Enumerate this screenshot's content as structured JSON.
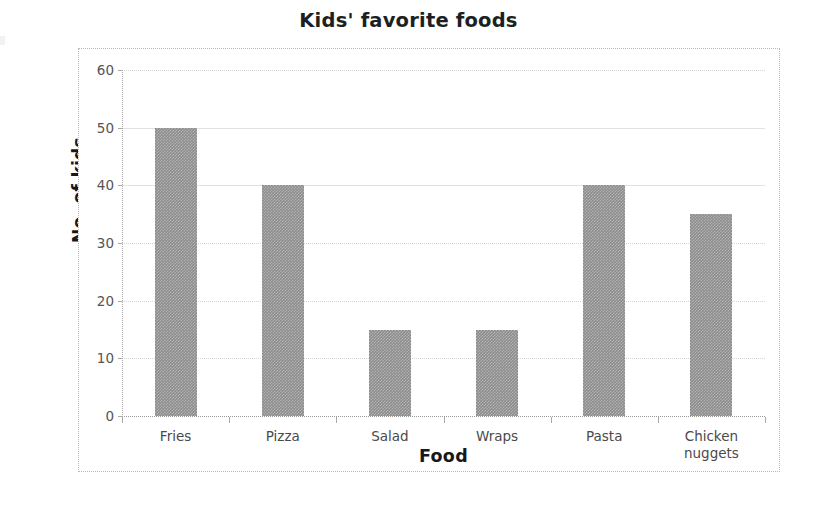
{
  "chart_data": {
    "type": "bar",
    "title": "Kids' favorite foods",
    "xlabel": "Food",
    "ylabel": "No. of kids",
    "categories": [
      "Fries",
      "Pizza",
      "Salad",
      "Wraps",
      "Pasta",
      "Chicken nuggets"
    ],
    "values": [
      50,
      40,
      15,
      15,
      40,
      35
    ],
    "ylim": [
      0,
      60
    ],
    "ytick_labels": [
      "0",
      "10",
      "20",
      "30",
      "40",
      "50",
      "60"
    ],
    "ytick_values": [
      0,
      10,
      20,
      30,
      40,
      50,
      60
    ],
    "grid": true,
    "legend": false,
    "bar_color": "#8c8c8c",
    "gridline_color": "#d5d5d5",
    "axis_color": "#a8a8a8",
    "title_color": "#201f1f",
    "tick_label_color": "#555555",
    "background_color": "#ffffff"
  },
  "x_category_lines": [
    [
      "Fries"
    ],
    [
      "Pizza"
    ],
    [
      "Salad"
    ],
    [
      "Wraps"
    ],
    [
      "Pasta"
    ],
    [
      "Chicken",
      "nuggets"
    ]
  ]
}
